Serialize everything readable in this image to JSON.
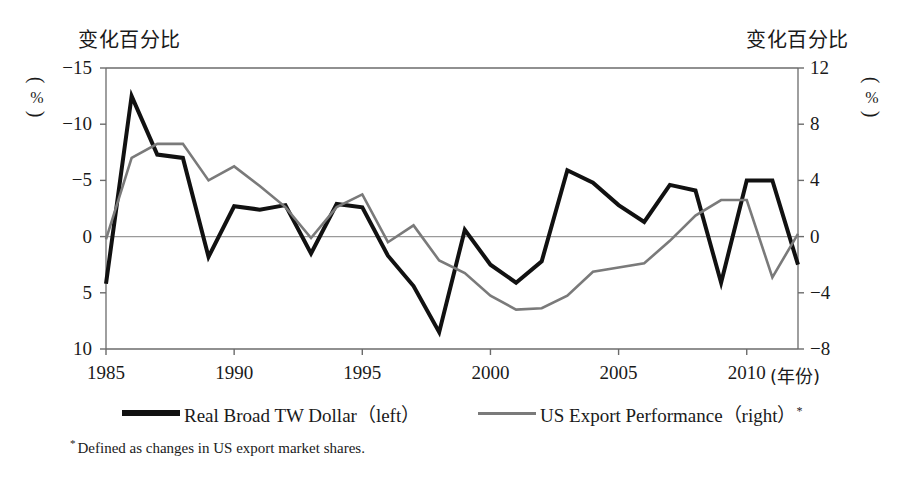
{
  "figure": {
    "left_axis_title": "变化百分比",
    "right_axis_title": "变化百分比",
    "left_unit": "%",
    "right_unit": "%",
    "x_unit": "(年份)",
    "footnote_marker": "*",
    "footnote_text": "Defined as changes in US export market shares.",
    "colors": {
      "series_dollar": "#111111",
      "series_export": "#7a7a7a",
      "axis": "#6b6b6b",
      "grid": "#9a9a9a",
      "background": "#ffffff"
    }
  },
  "legend": {
    "items": [
      {
        "label": "Real Broad TW Dollar",
        "side": "（left）",
        "marker": ""
      },
      {
        "label": "US Export Performance",
        "side": "（right）",
        "marker": "*"
      }
    ]
  },
  "chart_data": {
    "type": "line",
    "title": "",
    "xlabel": "(年份)",
    "ylabel": "变化百分比",
    "grid": true,
    "legend_position": "bottom",
    "x": [
      1985,
      1986,
      1987,
      1988,
      1989,
      1990,
      1991,
      1992,
      1993,
      1994,
      1995,
      1996,
      1997,
      1998,
      1999,
      2000,
      2001,
      2002,
      2003,
      2004,
      2005,
      2006,
      2007,
      2008,
      2009,
      2010,
      2011,
      2012
    ],
    "x_ticks": [
      1985,
      1990,
      1995,
      2000,
      2005,
      2010
    ],
    "xlim": [
      1985,
      2012
    ],
    "axes": [
      {
        "name": "left",
        "ticks": [
          "-15",
          "-10",
          "-5",
          "0",
          "5",
          "10"
        ],
        "tick_values": [
          -15,
          -10,
          -5,
          0,
          5,
          10
        ],
        "ylim": [
          -15,
          10
        ],
        "inverted": true,
        "unit": "%"
      },
      {
        "name": "right",
        "ticks": [
          "12",
          "8",
          "4",
          "0",
          "-4",
          "-8"
        ],
        "tick_values": [
          12,
          8,
          4,
          0,
          -4,
          -8
        ],
        "ylim": [
          -8,
          12
        ],
        "inverted": false,
        "unit": "%"
      }
    ],
    "series": [
      {
        "name": "Real Broad TW Dollar",
        "axis": "left",
        "color": "#111111",
        "width": 4,
        "values": [
          4.2,
          -12.5,
          -7.3,
          -7.0,
          1.8,
          -2.7,
          -2.4,
          -2.8,
          1.5,
          -2.9,
          -2.6,
          1.7,
          4.4,
          8.5,
          -0.6,
          2.5,
          4.1,
          2.2,
          -5.9,
          -4.8,
          -2.8,
          -1.3,
          -4.6,
          -4.1,
          4.1,
          -5.0,
          -5.0,
          2.5
        ]
      },
      {
        "name": "US Export Performance",
        "axis": "right",
        "color": "#7a7a7a",
        "width": 2.6,
        "values": [
          -0.2,
          5.6,
          6.6,
          6.6,
          4.0,
          5.0,
          3.6,
          2.1,
          -0.1,
          2.1,
          3.0,
          -0.4,
          0.8,
          -1.7,
          -2.6,
          -4.2,
          -5.2,
          -5.1,
          -4.2,
          -2.5,
          -2.2,
          -1.9,
          -0.3,
          1.5,
          2.6,
          2.6,
          -2.9,
          0.2
        ]
      }
    ]
  }
}
